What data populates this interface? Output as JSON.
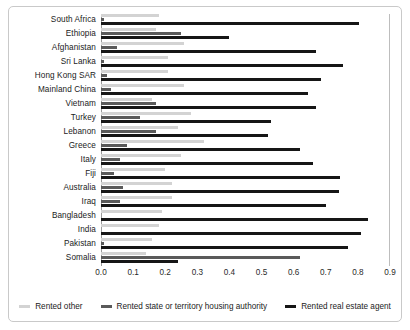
{
  "chart_data": {
    "type": "bar",
    "orientation": "horizontal",
    "title": "",
    "xlabel": "",
    "ylabel": "",
    "xlim": [
      0.0,
      0.9
    ],
    "grid": false,
    "legend_position": "bottom",
    "xticks": [
      "0.0",
      "0.1",
      "0.2",
      "0.3",
      "0.4",
      "0.5",
      "0.6",
      "0.7",
      "0.8",
      "0.9"
    ],
    "xtick_values": [
      0.0,
      0.1,
      0.2,
      0.3,
      0.4,
      0.5,
      0.6,
      0.7,
      0.8,
      0.9
    ],
    "categories": [
      "South Africa",
      "Ethiopia",
      "Afghanistan",
      "Sri Lanka",
      "Hong Kong SAR",
      "Mainland China",
      "Vietnam",
      "Turkey",
      "Lebanon",
      "Greece",
      "Italy",
      "Fiji",
      "Australia",
      "Iraq",
      "Bangladesh",
      "India",
      "Pakistan",
      "Somalia"
    ],
    "series": [
      {
        "name": "Rented other",
        "color": "#d3d3d3",
        "values": [
          0.18,
          0.17,
          0.26,
          0.21,
          0.21,
          0.26,
          0.16,
          0.28,
          0.24,
          0.32,
          0.25,
          0.2,
          0.22,
          0.22,
          0.19,
          0.18,
          0.16,
          0.14
        ]
      },
      {
        "name": "Rented state or territory housing authority",
        "color": "#5a5a5a",
        "values": [
          0.01,
          0.25,
          0.05,
          0.01,
          0.02,
          0.03,
          0.17,
          0.12,
          0.17,
          0.08,
          0.06,
          0.04,
          0.07,
          0.06,
          0.0,
          0.0,
          0.01,
          0.62
        ]
      },
      {
        "name": "Rented real estate agent",
        "color": "#161616",
        "values": [
          0.805,
          0.4,
          0.67,
          0.755,
          0.685,
          0.645,
          0.67,
          0.53,
          0.52,
          0.62,
          0.66,
          0.745,
          0.74,
          0.7,
          0.83,
          0.81,
          0.77,
          0.24
        ]
      }
    ],
    "legend": [
      {
        "label": "Rented other",
        "color": "#d3d3d3"
      },
      {
        "label": "Rented state or territory housing authority",
        "color": "#5a5a5a"
      },
      {
        "label": "Rented real estate agent",
        "color": "#161616"
      }
    ]
  }
}
